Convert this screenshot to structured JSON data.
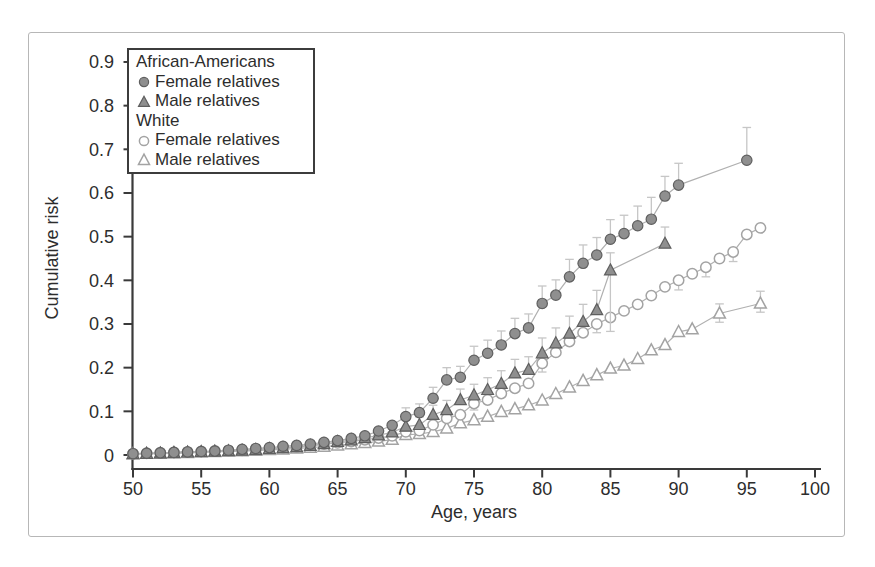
{
  "style": {
    "background": "#ffffff",
    "figure_border": "#b7b7b7",
    "text_color": "#2d2d2d",
    "axis_color": "#3a3a3a",
    "line_color": "#b0b0b0",
    "error_color": "#c6c6c6",
    "filled_fill": "#8f8f8f",
    "filled_stroke": "#5f5f5f",
    "open_stroke": "#a3a3a3",
    "open_fill": "#ffffff",
    "legend_border": "#3c3c3c"
  },
  "legend": {
    "groups": [
      {
        "header": "African-Americans",
        "items": [
          {
            "label": "Female relatives",
            "marker": "filled-circle"
          },
          {
            "label": "Male relatives",
            "marker": "filled-triangle"
          }
        ]
      },
      {
        "header": "White",
        "items": [
          {
            "label": "Female relatives",
            "marker": "open-circle"
          },
          {
            "label": "Male relatives",
            "marker": "open-triangle"
          }
        ]
      }
    ]
  },
  "chart_data": {
    "type": "line",
    "title": "",
    "xlabel": "Age, years",
    "ylabel": "Cumulative risk",
    "xlim": [
      50,
      100
    ],
    "ylim": [
      0,
      0.9
    ],
    "x_ticks": [
      50,
      55,
      60,
      65,
      70,
      75,
      80,
      85,
      90,
      95,
      100
    ],
    "y_ticks": [
      0,
      0.1,
      0.2,
      0.3,
      0.4,
      0.5,
      0.6,
      0.7,
      0.8,
      0.9
    ],
    "grid": false,
    "legend_position": "top-left",
    "point_format": "[age, cumulative_risk, err_up, err_down]",
    "series": [
      {
        "id": "aa-female",
        "name": "African-Americans Female relatives",
        "marker": "filled-circle",
        "points": [
          [
            50,
            0.003
          ],
          [
            51,
            0.004
          ],
          [
            52,
            0.005
          ],
          [
            53,
            0.006
          ],
          [
            54,
            0.007
          ],
          [
            55,
            0.008
          ],
          [
            56,
            0.009
          ],
          [
            57,
            0.011
          ],
          [
            58,
            0.013
          ],
          [
            59,
            0.015
          ],
          [
            60,
            0.017
          ],
          [
            61,
            0.02
          ],
          [
            62,
            0.022
          ],
          [
            63,
            0.025
          ],
          [
            64,
            0.029
          ],
          [
            65,
            0.033
          ],
          [
            66,
            0.038
          ],
          [
            67,
            0.044
          ],
          [
            68,
            0.055
          ],
          [
            69,
            0.068
          ],
          [
            70,
            0.088,
            0.02
          ],
          [
            71,
            0.097,
            0.02
          ],
          [
            72,
            0.13,
            0.025
          ],
          [
            73,
            0.172,
            0.028
          ],
          [
            74,
            0.178,
            0.025
          ],
          [
            75,
            0.217,
            0.032
          ],
          [
            76,
            0.233,
            0.03
          ],
          [
            77,
            0.252,
            0.032
          ],
          [
            78,
            0.278,
            0.035
          ],
          [
            79,
            0.291,
            0.032
          ],
          [
            80,
            0.347,
            0.04
          ],
          [
            81,
            0.366,
            0.035
          ],
          [
            82,
            0.408,
            0.04
          ],
          [
            83,
            0.439,
            0.042
          ],
          [
            84,
            0.458,
            0.04
          ],
          [
            85,
            0.494,
            0.045
          ],
          [
            86,
            0.507,
            0.042
          ],
          [
            87,
            0.525,
            0.045
          ],
          [
            88,
            0.54,
            0.05
          ],
          [
            89,
            0.593,
            0.045
          ],
          [
            90,
            0.618,
            0.05
          ],
          [
            95,
            0.675,
            0.075
          ]
        ]
      },
      {
        "id": "aa-male",
        "name": "African-Americans Male relatives",
        "marker": "filled-triangle",
        "points": [
          [
            50,
            0.002
          ],
          [
            51,
            0.003
          ],
          [
            52,
            0.004
          ],
          [
            53,
            0.005
          ],
          [
            54,
            0.006
          ],
          [
            55,
            0.007
          ],
          [
            56,
            0.008
          ],
          [
            57,
            0.009
          ],
          [
            58,
            0.01
          ],
          [
            59,
            0.012
          ],
          [
            60,
            0.014
          ],
          [
            61,
            0.016
          ],
          [
            62,
            0.018
          ],
          [
            63,
            0.021
          ],
          [
            64,
            0.025
          ],
          [
            65,
            0.03
          ],
          [
            66,
            0.034
          ],
          [
            67,
            0.039
          ],
          [
            68,
            0.045
          ],
          [
            69,
            0.052
          ],
          [
            70,
            0.065,
            0.018
          ],
          [
            71,
            0.069,
            0.018
          ],
          [
            72,
            0.092,
            0.022
          ],
          [
            73,
            0.103,
            0.022
          ],
          [
            74,
            0.126,
            0.025
          ],
          [
            75,
            0.137,
            0.025
          ],
          [
            76,
            0.149,
            0.028
          ],
          [
            77,
            0.163,
            0.03
          ],
          [
            78,
            0.187,
            0.032
          ],
          [
            79,
            0.195,
            0.03
          ],
          [
            80,
            0.233,
            0.035
          ],
          [
            81,
            0.256,
            0.035
          ],
          [
            82,
            0.278,
            0.04
          ],
          [
            83,
            0.305,
            0.04
          ],
          [
            84,
            0.332,
            0.045
          ],
          [
            85,
            0.423,
            0.04,
            0.14
          ],
          [
            89,
            0.484,
            0.038
          ]
        ]
      },
      {
        "id": "white-female",
        "name": "White Female relatives",
        "marker": "open-circle",
        "points": [
          [
            50,
            0.003
          ],
          [
            51,
            0.004
          ],
          [
            52,
            0.005
          ],
          [
            53,
            0.006
          ],
          [
            54,
            0.007
          ],
          [
            55,
            0.008
          ],
          [
            56,
            0.009
          ],
          [
            57,
            0.01
          ],
          [
            58,
            0.011
          ],
          [
            59,
            0.013
          ],
          [
            60,
            0.015
          ],
          [
            61,
            0.017
          ],
          [
            62,
            0.019
          ],
          [
            63,
            0.022
          ],
          [
            64,
            0.025
          ],
          [
            65,
            0.028
          ],
          [
            66,
            0.031
          ],
          [
            67,
            0.035
          ],
          [
            68,
            0.039
          ],
          [
            69,
            0.044
          ],
          [
            70,
            0.053
          ],
          [
            71,
            0.056
          ],
          [
            72,
            0.069
          ],
          [
            73,
            0.084
          ],
          [
            74,
            0.092
          ],
          [
            75,
            0.118,
            0,
            0.015
          ],
          [
            76,
            0.126
          ],
          [
            77,
            0.141
          ],
          [
            78,
            0.153
          ],
          [
            79,
            0.164
          ],
          [
            80,
            0.21,
            0,
            0.02
          ],
          [
            81,
            0.235
          ],
          [
            82,
            0.26
          ],
          [
            83,
            0.28
          ],
          [
            84,
            0.3,
            0,
            0.02
          ],
          [
            85,
            0.315
          ],
          [
            86,
            0.33
          ],
          [
            87,
            0.345
          ],
          [
            88,
            0.365
          ],
          [
            89,
            0.385
          ],
          [
            90,
            0.4,
            0,
            0.022
          ],
          [
            91,
            0.415
          ],
          [
            92,
            0.43,
            0,
            0.022
          ],
          [
            93,
            0.45
          ],
          [
            94,
            0.465,
            0,
            0.022
          ],
          [
            95,
            0.505
          ],
          [
            96,
            0.52
          ]
        ]
      },
      {
        "id": "white-male",
        "name": "White Male relatives",
        "marker": "open-triangle",
        "points": [
          [
            50,
            0.002
          ],
          [
            51,
            0.003
          ],
          [
            52,
            0.003
          ],
          [
            53,
            0.004
          ],
          [
            54,
            0.005
          ],
          [
            55,
            0.006
          ],
          [
            56,
            0.007
          ],
          [
            57,
            0.008
          ],
          [
            58,
            0.009
          ],
          [
            59,
            0.01
          ],
          [
            60,
            0.012
          ],
          [
            61,
            0.013
          ],
          [
            62,
            0.015
          ],
          [
            63,
            0.017
          ],
          [
            64,
            0.019
          ],
          [
            65,
            0.022
          ],
          [
            66,
            0.025
          ],
          [
            67,
            0.028
          ],
          [
            68,
            0.031
          ],
          [
            69,
            0.035
          ],
          [
            70,
            0.046
          ],
          [
            71,
            0.048
          ],
          [
            72,
            0.053
          ],
          [
            73,
            0.061
          ],
          [
            74,
            0.073
          ],
          [
            75,
            0.08
          ],
          [
            76,
            0.088
          ],
          [
            77,
            0.099
          ],
          [
            78,
            0.105
          ],
          [
            79,
            0.114
          ],
          [
            80,
            0.125
          ],
          [
            81,
            0.14
          ],
          [
            82,
            0.155
          ],
          [
            83,
            0.17
          ],
          [
            84,
            0.183
          ],
          [
            85,
            0.198
          ],
          [
            86,
            0.205
          ],
          [
            87,
            0.22
          ],
          [
            88,
            0.24
          ],
          [
            89,
            0.252
          ],
          [
            90,
            0.282
          ],
          [
            91,
            0.288
          ],
          [
            93,
            0.324,
            0.022,
            0.02
          ],
          [
            96,
            0.347,
            0.028,
            0.02
          ]
        ]
      }
    ]
  }
}
